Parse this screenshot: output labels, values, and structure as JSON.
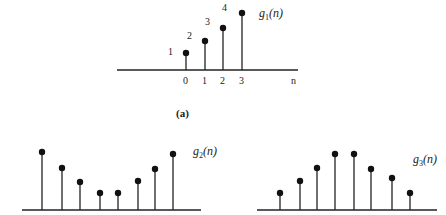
{
  "panel_a": {
    "caption": "(a)",
    "function_label": {
      "name": "g",
      "sub": "1",
      "arg": "(n)"
    },
    "axis_label": "n",
    "ticks": [
      "0",
      "1",
      "2",
      "3"
    ],
    "value_labels": [
      "1",
      "2",
      "3",
      "4"
    ],
    "samples": [
      {
        "n": 0,
        "value": 1
      },
      {
        "n": 1,
        "value": 2
      },
      {
        "n": 2,
        "value": 3
      },
      {
        "n": 3,
        "value": 4
      }
    ]
  },
  "panel_b": {
    "function_label": {
      "name": "g",
      "sub": "2",
      "arg": "(n)"
    },
    "shape": "U-shaped (symmetric valley)",
    "relative_heights": [
      4.2,
      3.1,
      2.1,
      1.2,
      1.2,
      2.2,
      3.0,
      4.0
    ]
  },
  "panel_c": {
    "function_label": {
      "name": "g",
      "sub": "3",
      "arg": "(n)"
    },
    "shape": "bell-shaped (symmetric hill)",
    "relative_heights": [
      1.2,
      2.2,
      3.0,
      4.2,
      4.2,
      2.9,
      2.3,
      1.2
    ]
  },
  "colors": {
    "ink": "#222222",
    "background": "#ffffff"
  }
}
